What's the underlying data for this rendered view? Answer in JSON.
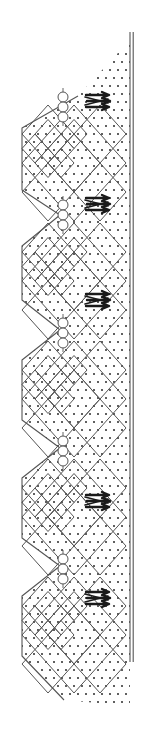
{
  "figure": {
    "width": 155,
    "height": 746,
    "background_color": "#ffffff",
    "line_color": "#555555",
    "stipple_color": "#3a3a3a",
    "arrow_color": "#1a1a1a"
  },
  "chart_data": {
    "type": "diagram",
    "title": "",
    "xlabel": "",
    "ylabel": "",
    "elements": {
      "stipple_field": {
        "label": "dotted matrix",
        "dot_spacing_px": 8,
        "dot_radius_px": 1.1,
        "top_y": 40,
        "bottom_y": 706
      },
      "right_wall": {
        "label": "vertical boundary wall",
        "x": 130,
        "y_top": 32,
        "y_bottom": 662,
        "stroke_count": 2
      },
      "left_contact": {
        "label": "sawtooth contact line",
        "vertices": [
          [
            78,
            96
          ],
          [
            22,
            128
          ],
          [
            22,
            190
          ],
          [
            60,
            215
          ],
          [
            22,
            246
          ],
          [
            22,
            300
          ],
          [
            60,
            330
          ],
          [
            22,
            360
          ],
          [
            22,
            420
          ],
          [
            60,
            448
          ],
          [
            22,
            478
          ],
          [
            22,
            538
          ],
          [
            60,
            566
          ],
          [
            22,
            596
          ],
          [
            22,
            656
          ],
          [
            64,
            700
          ]
        ]
      },
      "diamond_cells": [
        {
          "cx": 74,
          "cy": 163,
          "rx": 52,
          "ry": 58,
          "subdivisions": 2
        },
        {
          "cx": 74,
          "cy": 281,
          "rx": 52,
          "ry": 58,
          "subdivisions": 2
        },
        {
          "cx": 74,
          "cy": 399,
          "rx": 52,
          "ry": 58,
          "subdivisions": 2
        },
        {
          "cx": 74,
          "cy": 517,
          "rx": 52,
          "ry": 58,
          "subdivisions": 2
        },
        {
          "cx": 74,
          "cy": 635,
          "rx": 52,
          "ry": 58,
          "subdivisions": 2
        }
      ],
      "circle_chains": [
        {
          "x": 63,
          "y_top": 92,
          "count": 3,
          "radius": 5
        },
        {
          "x": 63,
          "y_top": 200,
          "count": 3,
          "radius": 5
        },
        {
          "x": 63,
          "y_top": 318,
          "count": 3,
          "radius": 5
        },
        {
          "x": 63,
          "y_top": 436,
          "count": 3,
          "radius": 5
        },
        {
          "x": 63,
          "y_top": 554,
          "count": 3,
          "radius": 5
        }
      ],
      "flow_arrows": [
        {
          "x": 100,
          "y": 101,
          "direction": "right",
          "label": "flow-arrow-1"
        },
        {
          "x": 100,
          "y": 204,
          "direction": "right",
          "label": "flow-arrow-2"
        },
        {
          "x": 100,
          "y": 300,
          "direction": "right",
          "label": "flow-arrow-3"
        },
        {
          "x": 100,
          "y": 501,
          "direction": "right",
          "label": "flow-arrow-4"
        },
        {
          "x": 100,
          "y": 598,
          "direction": "right",
          "label": "flow-arrow-5"
        }
      ]
    },
    "legend": [],
    "annotations": []
  }
}
